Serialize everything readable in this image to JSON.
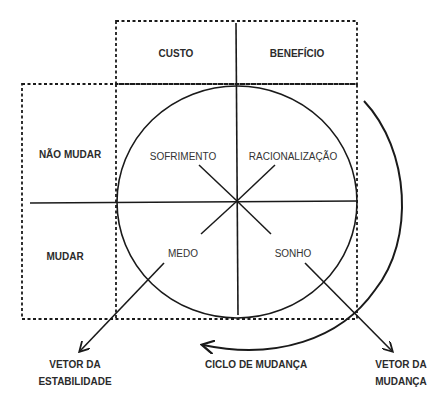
{
  "diagram": {
    "header_row": {
      "left": "CUSTO",
      "right": "BENEFÍCIO"
    },
    "side_rows": {
      "top": "NÃO MUDAR",
      "bottom": "MUDAR"
    },
    "quadrants": {
      "top_left": "SOFRIMENTO",
      "top_right": "RACIONALIZAÇÃO",
      "bottom_left": "MEDO",
      "bottom_right": "SONHO"
    },
    "vectors": {
      "stability": {
        "line1": "VETOR DA",
        "line2": "ESTABILIDADE"
      },
      "change": {
        "line1": "VETOR DA",
        "line2": "MUDANÇA"
      }
    },
    "cycle_label": "CICLO DE MUDANÇA",
    "colors": {
      "stroke": "#1a1a1a",
      "text": "#2b2b2b",
      "background": "#ffffff"
    }
  }
}
